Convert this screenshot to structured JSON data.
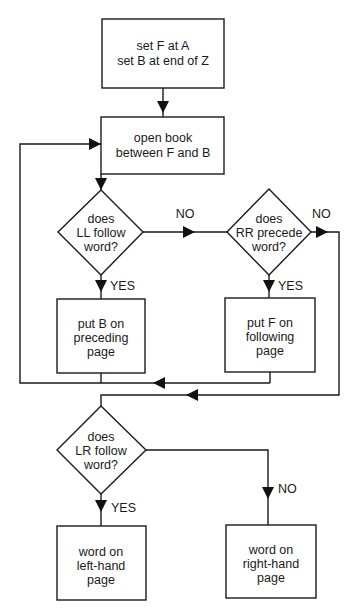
{
  "diagram": {
    "type": "flowchart",
    "colors": {
      "line": "#1a1a1a",
      "background": "#ffffff"
    },
    "nodes": {
      "start": {
        "shape": "process",
        "lines": [
          "set F at A",
          "set B at end of Z"
        ]
      },
      "open": {
        "shape": "process",
        "lines": [
          "open book",
          "between F and B"
        ]
      },
      "ll": {
        "shape": "decision",
        "lines": [
          "does",
          "LL follow",
          "word?"
        ]
      },
      "rr": {
        "shape": "decision",
        "lines": [
          "does",
          "RR precede",
          "word?"
        ]
      },
      "putb": {
        "shape": "process",
        "lines": [
          "put B on",
          "preceding",
          "page"
        ]
      },
      "putf": {
        "shape": "process",
        "lines": [
          "put F on",
          "following",
          "page"
        ]
      },
      "lr": {
        "shape": "decision",
        "lines": [
          "does",
          "LR follow",
          "word?"
        ]
      },
      "left": {
        "shape": "terminal-process",
        "lines": [
          "word on",
          "left-hand",
          "page"
        ]
      },
      "right": {
        "shape": "terminal-process",
        "lines": [
          "word on",
          "right-hand",
          "page"
        ]
      }
    },
    "labels": {
      "ll_no": "NO",
      "ll_yes": "YES",
      "rr_no": "NO",
      "rr_yes": "YES",
      "lr_yes": "YES",
      "lr_no": "NO"
    },
    "edges": [
      {
        "from": "start",
        "to": "open"
      },
      {
        "from": "open",
        "to": "ll"
      },
      {
        "from": "ll",
        "to": "rr",
        "label": "NO"
      },
      {
        "from": "ll",
        "to": "putb",
        "label": "YES"
      },
      {
        "from": "rr",
        "to": "putf",
        "label": "YES"
      },
      {
        "from": "rr",
        "to": "lr",
        "label": "NO"
      },
      {
        "from": "putb",
        "to": "open"
      },
      {
        "from": "putf",
        "to": "open"
      },
      {
        "from": "lr",
        "to": "left",
        "label": "YES"
      },
      {
        "from": "lr",
        "to": "right",
        "label": "NO"
      }
    ]
  }
}
